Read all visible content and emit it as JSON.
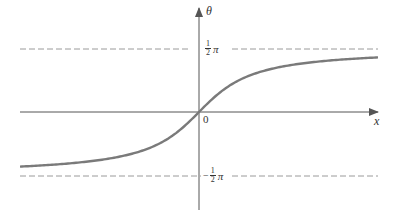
{
  "chart_data": {
    "type": "line",
    "title": "",
    "function": "theta = arctan(x)",
    "xlabel": "x",
    "ylabel": "θ",
    "origin_label": "0",
    "asymptotes": [
      {
        "value": "π/2",
        "label_num": "1",
        "label_den": "2",
        "label_sym": "π",
        "sign": ""
      },
      {
        "value": "-π/2",
        "label_num": "1",
        "label_den": "2",
        "label_sym": "π",
        "sign": "−"
      }
    ],
    "xlim": [
      -4.5,
      4.5
    ],
    "ylim": [
      -1.9,
      1.9
    ],
    "grid": false,
    "legend": "none",
    "colors": {
      "curve": "#7a7a7a",
      "axes": "#555555",
      "asymptote": "#9a9a9a"
    }
  }
}
